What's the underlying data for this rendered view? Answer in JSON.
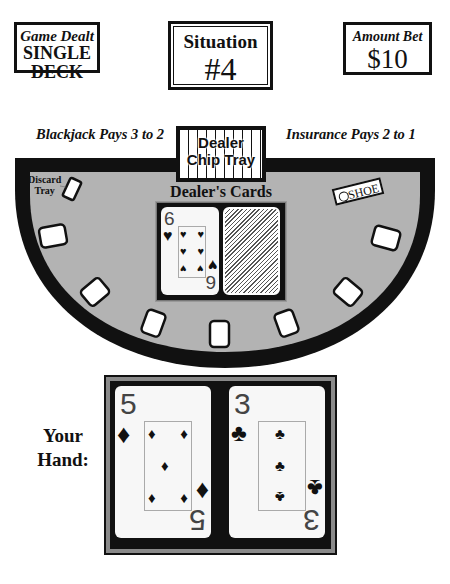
{
  "header": {
    "game_dealt": {
      "label": "Game Dealt",
      "line1": "SINGLE",
      "line2": "DECK"
    },
    "situation": {
      "label": "Situation",
      "number": "#4"
    },
    "amount_bet": {
      "label": "Amount Bet",
      "value": "$10"
    }
  },
  "table": {
    "blackjack_rule": "Blackjack Pays 3 to 2",
    "insurance_rule": "Insurance Pays 2 to 1",
    "chip_tray": {
      "line1": "Dealer",
      "line2": "Chip Tray"
    },
    "discard_tray": {
      "line1": "Discard",
      "line2": "Tray"
    },
    "shoe_label": "SHOE",
    "felt_color": "#b3b3b3",
    "rail_color": "#111111",
    "betting_spots": 7
  },
  "dealer": {
    "label": "Dealer's Cards",
    "cards": [
      {
        "rank": "6",
        "rank_bottom": "9",
        "suit": "hearts",
        "suit_symbol": "♥",
        "face_up": true
      },
      {
        "face_up": false,
        "back": "diagonal-stripes"
      }
    ]
  },
  "player": {
    "label_line1": "Your",
    "label_line2": "Hand:",
    "cards": [
      {
        "rank": "5",
        "suit": "diamonds",
        "suit_symbol": "♦",
        "face_up": true
      },
      {
        "rank": "3",
        "suit": "clubs",
        "suit_symbol": "♣",
        "face_up": true
      }
    ]
  }
}
